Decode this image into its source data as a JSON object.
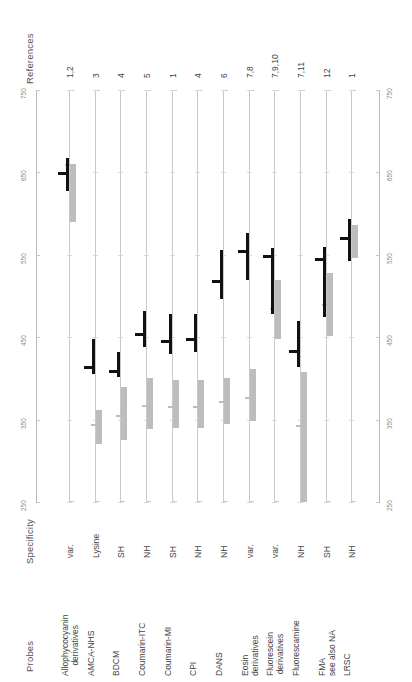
{
  "labels": {
    "references": "References",
    "specificity": "Specificity",
    "probes": "Probes"
  },
  "axis": {
    "ticks": [
      "250",
      "350",
      "450",
      "550",
      "650",
      "750"
    ],
    "min": 250,
    "max": 750,
    "unit": "nm"
  },
  "colors": {
    "excitation": "#111111",
    "emission": "#bdbdbd",
    "axis": "#c9c9c9",
    "text": "#444444"
  },
  "chart_data": {
    "type": "bar",
    "title": "",
    "xlabel": "Probes",
    "ylabel": "Wavelength (nm)",
    "ylim": [
      250,
      750
    ],
    "grid": true,
    "legend": [
      "Excitation (black)",
      "Emission (grey)"
    ],
    "categories": [
      "Allophycocyanin derivatives",
      "AMCA-NHS",
      "BDCM",
      "Coumarin-ITC",
      "Coumarin-MI",
      "CPI",
      "DANS",
      "Eosin derivatives",
      "Fluorescein derivatives",
      "Fluorescamine",
      "FMA",
      "LRSC"
    ],
    "series": [
      {
        "name": "Excitation",
        "ranges": [
          [
            628,
            668
          ],
          [
            405,
            448
          ],
          [
            402,
            432
          ],
          [
            438,
            482
          ],
          [
            430,
            478
          ],
          [
            432,
            478
          ],
          [
            496,
            556
          ],
          [
            520,
            576
          ],
          [
            478,
            558
          ],
          [
            414,
            470
          ],
          [
            474,
            560
          ],
          [
            542,
            594
          ]
        ],
        "typical": [
          650,
          415,
          410,
          455,
          447,
          449,
          520,
          556,
          550,
          434,
          546,
          572
        ]
      },
      {
        "name": "Emission",
        "ranges": [
          [
            590,
            660
          ],
          [
            320,
            362
          ],
          [
            325,
            390
          ],
          [
            338,
            400
          ],
          [
            340,
            398
          ],
          [
            340,
            398
          ],
          [
            345,
            400
          ],
          [
            348,
            412
          ],
          [
            448,
            520
          ],
          [
            250,
            408
          ],
          [
            452,
            528
          ],
          [
            546,
            586
          ]
        ],
        "typical": [
          660,
          345,
          355,
          368,
          367,
          366,
          372,
          378,
          485,
          344,
          490,
          570
        ]
      }
    ]
  },
  "columns": [
    {
      "probe_line1": "Allophycocyanin",
      "probe_line2": "derivatives",
      "specificity": "var.",
      "references": "1,2"
    },
    {
      "probe_line1": "AMCA-NHS",
      "probe_line2": "",
      "specificity": "Lysine",
      "references": "3"
    },
    {
      "probe_line1": "BDCM",
      "probe_line2": "",
      "specificity": "SH",
      "references": "4"
    },
    {
      "probe_line1": "Coumarin-ITC",
      "probe_line2": "",
      "specificity": "NH",
      "references": "5"
    },
    {
      "probe_line1": "Coumarin-MI",
      "probe_line2": "",
      "specificity": "SH",
      "references": "1"
    },
    {
      "probe_line1": "CPI",
      "probe_line2": "",
      "specificity": "NH",
      "references": "4"
    },
    {
      "probe_line1": "DANS",
      "probe_line2": "",
      "specificity": "NH",
      "references": "6"
    },
    {
      "probe_line1": "Eosin",
      "probe_line2": "derivatives",
      "specificity": "var.",
      "references": "7,8"
    },
    {
      "probe_line1": "Fluorescein",
      "probe_line2": "derivatives",
      "specificity": "var.",
      "references": "7,9,10"
    },
    {
      "probe_line1": "Fluorescamine",
      "probe_line2": "",
      "specificity": "NH",
      "references": "7,11"
    },
    {
      "probe_line1": "FMA",
      "probe_line2": "see also NA",
      "specificity": "SH",
      "references": "12"
    },
    {
      "probe_line1": "LRSC",
      "probe_line2": "",
      "specificity": "NH",
      "references": "1"
    }
  ]
}
